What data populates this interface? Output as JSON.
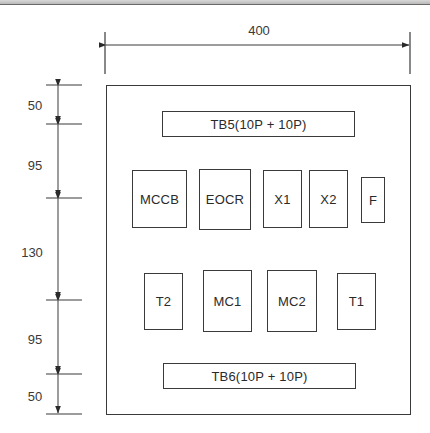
{
  "drawing": {
    "overall_width_label": "400",
    "vertical_dimensions": [
      {
        "label": "50",
        "from_y": 85,
        "to_y": 124
      },
      {
        "label": "95",
        "from_y": 124,
        "to_y": 198
      },
      {
        "label": "130",
        "from_y": 198,
        "to_y": 300
      },
      {
        "label": "95",
        "from_y": 300,
        "to_y": 374
      },
      {
        "label": "50",
        "from_y": 374,
        "to_y": 414
      }
    ],
    "components": {
      "tb5": "TB5(10P + 10P)",
      "mccb": "MCCB",
      "eocr": "EOCR",
      "x1": "X1",
      "x2": "X2",
      "f": "F",
      "t2": "T2",
      "mc1": "MC1",
      "mc2": "MC2",
      "t1": "T1",
      "tb6": "TB6(10P + 10P)"
    },
    "line_color": "#3a3a3a"
  }
}
